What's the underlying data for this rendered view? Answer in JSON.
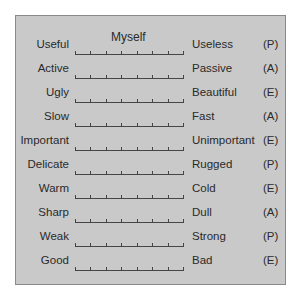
{
  "scale_title": "Myself",
  "scale_points": 7,
  "rows": [
    {
      "left": "Useful",
      "right": "Useless",
      "factor": "(P)"
    },
    {
      "left": "Active",
      "right": "Passive",
      "factor": "(A)"
    },
    {
      "left": "Ugly",
      "right": "Beautiful",
      "factor": "(E)"
    },
    {
      "left": "Slow",
      "right": "Fast",
      "factor": "(A)"
    },
    {
      "left": "Important",
      "right": "Unimportant",
      "factor": "(E)"
    },
    {
      "left": "Delicate",
      "right": "Rugged",
      "factor": "(P)"
    },
    {
      "left": "Warm",
      "right": "Cold",
      "factor": "(E)"
    },
    {
      "left": "Sharp",
      "right": "Dull",
      "factor": "(A)"
    },
    {
      "left": "Weak",
      "right": "Strong",
      "factor": "(P)"
    },
    {
      "left": "Good",
      "right": "Bad",
      "factor": "(E)"
    }
  ],
  "colors": {
    "panel": "#c9c9c9",
    "border": "#8a8a8a",
    "text": "#2a2a2a"
  }
}
